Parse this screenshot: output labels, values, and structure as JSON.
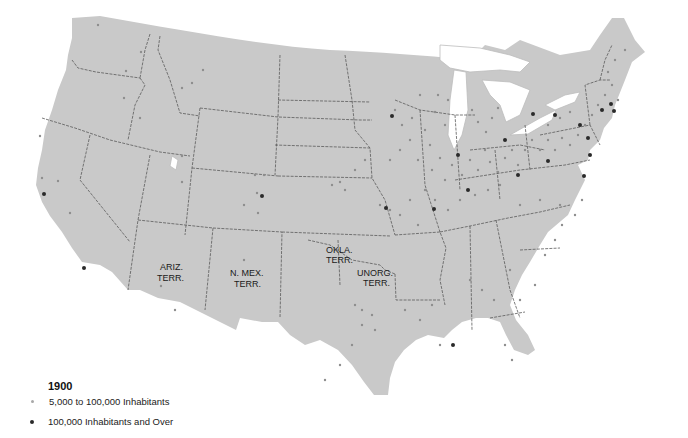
{
  "map": {
    "title": "1900",
    "region": "Contiguous United States",
    "territory_labels": [
      {
        "line1": "ARIZ.",
        "line2": "TERR.",
        "x": 172,
        "y": 270
      },
      {
        "line1": "N. MEX.",
        "line2": "TERR.",
        "x": 244,
        "y": 276
      },
      {
        "line1": "OKLA.",
        "line2": "TERR.",
        "x": 334,
        "y": 253
      },
      {
        "line1": "UNORG.",
        "line2": "TERR.",
        "x": 372,
        "y": 276
      }
    ],
    "colors": {
      "land": "#c9c9c9",
      "border": "#5a5a5a",
      "small_city": "#8e8e8e",
      "large_city": "#2a2a2a",
      "water": "#ffffff"
    }
  },
  "legend": {
    "title": "1900",
    "items": [
      {
        "label": "5,000 to 100,000 Inhabitants",
        "symbol": "small-light-dot",
        "color": "#a8a8a8"
      },
      {
        "label": "100,000 Inhabitants and Over",
        "symbol": "large-dark-dot",
        "color": "#2a2a2a"
      }
    ]
  }
}
